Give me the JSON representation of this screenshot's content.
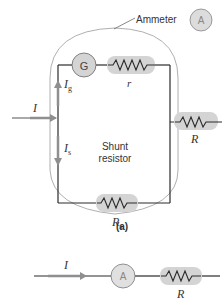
{
  "diagram_a": {
    "ammeter_label": "Ammeter",
    "ammeter_symbol": "A",
    "galvanometer_symbol": "G",
    "current_total": "I",
    "current_g": "I",
    "current_g_sub": "g",
    "current_s": "I",
    "current_s_sub": "s",
    "r_label": "r",
    "R_label": "R",
    "shunt_line1": "Shunt",
    "shunt_line2": "resistor",
    "Rs_label": "R",
    "Rs_sub": "s",
    "caption": "(a)"
  },
  "diagram_b": {
    "current": "I",
    "ammeter_symbol": "A",
    "R_label": "R"
  },
  "colors": {
    "wire": "#2a2a2a",
    "component_fill": "#d4d4d4",
    "arrow": "#8f8f8f",
    "outline": "#9a9a9a",
    "text": "#333333"
  }
}
